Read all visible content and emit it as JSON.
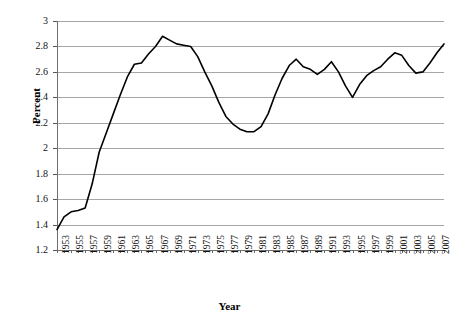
{
  "chart_data": {
    "type": "line",
    "title": "",
    "xlabel": "Year",
    "ylabel": "Percent",
    "xlim": [
      1953,
      2008
    ],
    "ylim": [
      1.2,
      3.0
    ],
    "grid": true,
    "legend": "none",
    "y_ticks": [
      "1.2",
      "1.4",
      "1.6",
      "1.8",
      "2",
      "2.2",
      "2.4",
      "2.6",
      "2.8",
      "3"
    ],
    "x_tick_labels": [
      "1953",
      "1955",
      "1957",
      "1959",
      "1961",
      "1963",
      "1965",
      "1967",
      "1969",
      "1971",
      "1973",
      "1975",
      "1977",
      "1979",
      "1981",
      "1983",
      "1985",
      "1987",
      "1989",
      "1991",
      "1993",
      "1995",
      "1997",
      "1999",
      "2001",
      "2003",
      "2005",
      "2007"
    ],
    "line_color": "#000000",
    "grid_color": "#a6a6a6",
    "x": [
      1953,
      1954,
      1955,
      1956,
      1957,
      1958,
      1959,
      1960,
      1961,
      1962,
      1963,
      1964,
      1965,
      1966,
      1967,
      1968,
      1969,
      1970,
      1971,
      1972,
      1973,
      1974,
      1975,
      1976,
      1977,
      1978,
      1979,
      1980,
      1981,
      1982,
      1983,
      1984,
      1985,
      1986,
      1987,
      1988,
      1989,
      1990,
      1991,
      1992,
      1993,
      1994,
      1995,
      1996,
      1997,
      1998,
      1999,
      2000,
      2001,
      2002,
      2003,
      2004,
      2005,
      2006,
      2007,
      2008
    ],
    "values": [
      1.36,
      1.46,
      1.5,
      1.51,
      1.53,
      1.72,
      1.97,
      2.12,
      2.27,
      2.42,
      2.56,
      2.66,
      2.67,
      2.74,
      2.8,
      2.88,
      2.85,
      2.82,
      2.81,
      2.8,
      2.72,
      2.6,
      2.49,
      2.36,
      2.25,
      2.19,
      2.15,
      2.13,
      2.13,
      2.17,
      2.27,
      2.42,
      2.55,
      2.65,
      2.7,
      2.64,
      2.62,
      2.58,
      2.62,
      2.68,
      2.6,
      2.49,
      2.4,
      2.5,
      2.57,
      2.61,
      2.64,
      2.7,
      2.75,
      2.73,
      2.65,
      2.59,
      2.6,
      2.67,
      2.75,
      2.82
    ]
  }
}
